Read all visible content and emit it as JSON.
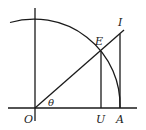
{
  "diagram": {
    "type": "unit-circle-trig-diagram",
    "stroke_color": "#1a1a1a",
    "background": "#ffffff",
    "points": {
      "O": {
        "label": "O",
        "x": 35,
        "y": 108
      },
      "U": {
        "label": "U",
        "x": 101,
        "y": 108
      },
      "A": {
        "label": "A",
        "x": 120,
        "y": 108
      },
      "E": {
        "label": "E",
        "x": 101,
        "y": 51
      },
      "I": {
        "label": "I",
        "x": 120,
        "y": 32
      }
    },
    "angle_label": "θ",
    "labels": {
      "O": "O",
      "U": "U",
      "A": "A",
      "E": "E",
      "I": "I",
      "theta": "θ"
    },
    "elements": [
      "horizontal axis",
      "vertical axis",
      "quarter circle arc centered at O through A",
      "ray from O through E to I",
      "vertical segment EU",
      "vertical segment IA (tangent line)"
    ]
  }
}
